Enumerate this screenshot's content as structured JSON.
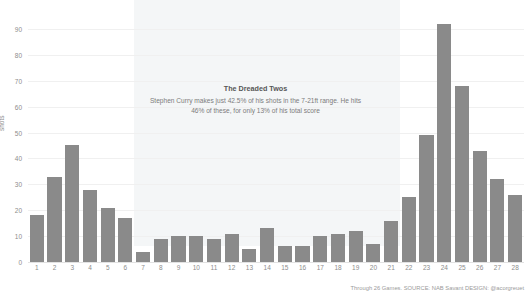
{
  "chart_data": {
    "type": "bar",
    "title": "Shot Distance",
    "xlabel": "",
    "ylabel": "shots",
    "ylim": [
      0,
      95
    ],
    "yticks": [
      0,
      10,
      20,
      30,
      40,
      50,
      60,
      70,
      80,
      90
    ],
    "grid": true,
    "legend": null,
    "categories": [
      "1",
      "2",
      "3",
      "4",
      "5",
      "6",
      "7",
      "8",
      "9",
      "10",
      "11",
      "12",
      "13",
      "14",
      "15",
      "16",
      "17",
      "18",
      "19",
      "20",
      "21",
      "22",
      "23",
      "24",
      "25",
      "26",
      "27",
      "28"
    ],
    "values": [
      18,
      33,
      45,
      28,
      21,
      17,
      4,
      9,
      10,
      10,
      9,
      11,
      5,
      13,
      6,
      6,
      10,
      11,
      12,
      7,
      16,
      25,
      49,
      92,
      68,
      43,
      32,
      26
    ],
    "bar_color": "#8a8a8a",
    "highlight_band": {
      "label": "7-21ft range",
      "from_category": "7",
      "to_category": "21",
      "color": "#f4f6f7"
    },
    "annotations": [
      {
        "title": "The Dreaded Twos",
        "line1": "Stephen Curry makes just 42.5% of his shots in the 7-21ft range. He hits",
        "line2": "46% of these, for only 13% of his total score"
      }
    ]
  },
  "footer": {
    "text": "Through 26 Games. SOURCE: NAB Savant DESIGN: @acorgreuet"
  }
}
